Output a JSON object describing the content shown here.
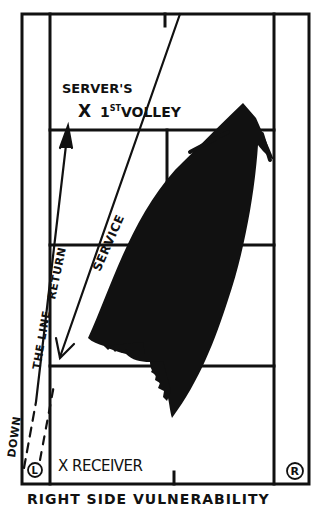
{
  "diagram": {
    "title": "RIGHT SIDE VULNERABILITY",
    "labels": {
      "server_first_volley_line1": "SERVER'S",
      "server_first_volley_x": "X",
      "server_first_volley_ord": "1",
      "server_first_volley_sup": "ST",
      "server_first_volley_word": "VOLLEY",
      "service": "SERVICE",
      "return": "DOWN THE LINE RETURN",
      "return_part1": "DOWN",
      "return_part2": "THE LINE",
      "return_part3": "RETURN",
      "receiver": "X RECEIVER",
      "left_marker": "L",
      "right_marker": "R"
    },
    "colors": {
      "ink": "#111111",
      "background": "#ffffff"
    },
    "court": {
      "outer_left_x": 22,
      "singles_left_x": 50,
      "singles_right_x": 274,
      "outer_right_x": 309,
      "top_baseline_y": 14,
      "upper_service_line_y": 130,
      "net_y": 245,
      "lower_service_line_y": 366,
      "bottom_baseline_y": 484,
      "center_line_x": 167
    }
  }
}
